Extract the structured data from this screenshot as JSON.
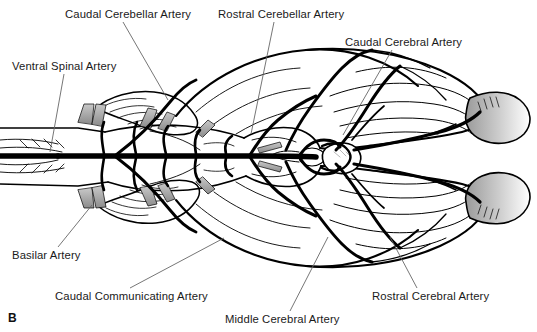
{
  "figure": {
    "panel_letter": "B",
    "view": "ventral view of brain arterial supply",
    "width": 537,
    "height": 332,
    "background_color": "#ffffff",
    "line_color": "#000000",
    "leader_line_color": "#555555",
    "shading_color": "#b5b5b5"
  },
  "labels": [
    {
      "id": "caudal-cerebellar-artery",
      "text": "Caudal Cerebellar Artery",
      "x": 65,
      "y": 8,
      "leader": {
        "x1": 123,
        "y1": 22,
        "x2": 168,
        "y2": 100
      }
    },
    {
      "id": "rostral-cerebellar-artery",
      "text": "Rostral Cerebellar Artery",
      "x": 218,
      "y": 8,
      "leader": {
        "x1": 274,
        "y1": 22,
        "x2": 251,
        "y2": 134
      }
    },
    {
      "id": "caudal-cerebral-artery",
      "text": "Caudal Cerebral Artery",
      "x": 345,
      "y": 36,
      "leader": {
        "x1": 392,
        "y1": 50,
        "x2": 343,
        "y2": 135
      }
    },
    {
      "id": "ventral-spinal-artery",
      "text": "Ventral Spinal Artery",
      "x": 12,
      "y": 60,
      "leader": {
        "x1": 64,
        "y1": 74,
        "x2": 50,
        "y2": 152
      }
    },
    {
      "id": "basilar-artery",
      "text": "Basilar Artery",
      "x": 12,
      "y": 249,
      "leader": {
        "x1": 58,
        "y1": 247,
        "x2": 92,
        "y2": 205
      }
    },
    {
      "id": "caudal-communicating-artery",
      "text": "Caudal Communicating Artery",
      "x": 55,
      "y": 290,
      "leader": {
        "x1": 130,
        "y1": 288,
        "x2": 224,
        "y2": 238
      }
    },
    {
      "id": "middle-cerebral-artery",
      "text": "Middle Cerebral Artery",
      "x": 225,
      "y": 313,
      "leader": {
        "x1": 290,
        "y1": 311,
        "x2": 328,
        "y2": 237
      }
    },
    {
      "id": "rostral-cerebral-artery",
      "text": "Rostral Cerebral Artery",
      "x": 372,
      "y": 290,
      "leader": {
        "x1": 417,
        "y1": 288,
        "x2": 390,
        "y2": 237
      }
    }
  ],
  "anatomy": {
    "structures": [
      "spinal-cord",
      "medulla-oblongata",
      "pons",
      "cerebellum",
      "cerebral-hemisphere-left",
      "cerebral-hemisphere-right",
      "olfactory-bulb-left",
      "olfactory-bulb-right",
      "hypophysis",
      "arterial-circle"
    ]
  }
}
